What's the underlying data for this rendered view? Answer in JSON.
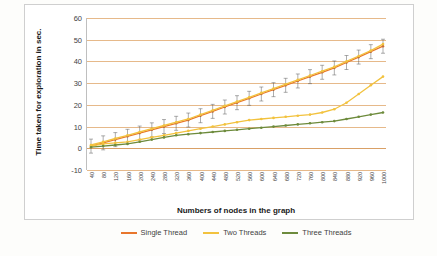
{
  "chart_data": {
    "type": "line",
    "title": "",
    "xlabel": "Numbers of nodes in the graph",
    "ylabel": "Time taken for exploration in sec.",
    "ylim": [
      -10,
      60
    ],
    "yticks": [
      -10,
      0,
      10,
      20,
      30,
      40,
      50,
      60
    ],
    "grid": true,
    "legend_position": "bottom",
    "error_bars": true,
    "categories": [
      40,
      80,
      120,
      160,
      200,
      240,
      280,
      320,
      360,
      400,
      440,
      480,
      520,
      560,
      600,
      640,
      680,
      720,
      760,
      800,
      840,
      880,
      920,
      960,
      1000
    ],
    "series": [
      {
        "name": "Single Thread",
        "color": "#e8762c",
        "values": [
          1.0,
          2.5,
          4.0,
          5.5,
          7.0,
          8.5,
          10.0,
          11.5,
          13.0,
          15.0,
          17.0,
          19.0,
          21.0,
          23.0,
          25.0,
          27.0,
          29.0,
          31.0,
          33.0,
          35.0,
          37.0,
          39.5,
          42.0,
          44.5,
          47.0
        ]
      },
      {
        "name": "Two Threads",
        "color": "#f2c23e",
        "values": [
          1.5,
          3.0,
          4.5,
          6.0,
          7.5,
          9.0,
          10.5,
          12.0,
          13.5,
          15.5,
          17.5,
          19.5,
          21.5,
          23.5,
          25.5,
          27.5,
          29.5,
          31.5,
          33.5,
          35.5,
          37.5,
          40.0,
          42.5,
          45.0,
          48.0
        ]
      },
      {
        "name": "Three Threads",
        "color": "#6d8b3c",
        "values": [
          0.5,
          1.0,
          1.5,
          2.0,
          2.5,
          3.0,
          3.5,
          4.0,
          4.5,
          5.0,
          5.5,
          6.0,
          6.5,
          7.0,
          7.5,
          8.0,
          8.5,
          9.0,
          9.5,
          10.0,
          10.5,
          11.5,
          12.5,
          14.0,
          16.5
        ]
      }
    ],
    "series_lower": [
      {
        "name": "Two Threads lower branch",
        "color": "#f2c23e",
        "values": [
          1.0,
          2.0,
          2.5,
          3.0,
          4.0,
          5.0,
          6.0,
          7.0,
          8.0,
          9.0,
          10.0,
          11.0,
          12.0,
          13.0,
          13.5,
          14.0,
          14.5,
          15.0,
          15.5,
          16.5,
          18.0,
          21.0,
          25.0,
          29.0,
          33.0
        ]
      },
      {
        "name": "Three Threads lower branch",
        "color": "#6d8b3c",
        "values": [
          0.5,
          1.0,
          1.5,
          2.0,
          3.0,
          4.0,
          5.0,
          6.0,
          6.5,
          7.0,
          7.5,
          8.0,
          8.5,
          9.0,
          9.5,
          10.0,
          10.5,
          11.0,
          11.5,
          12.0,
          12.5,
          13.5,
          14.5,
          15.5,
          16.5
        ]
      }
    ]
  },
  "legend": {
    "items": [
      {
        "label": "Single Thread",
        "color": "#e8762c"
      },
      {
        "label": "Two Threads",
        "color": "#f2c23e"
      },
      {
        "label": "Three Threads",
        "color": "#6d8b3c"
      }
    ]
  }
}
